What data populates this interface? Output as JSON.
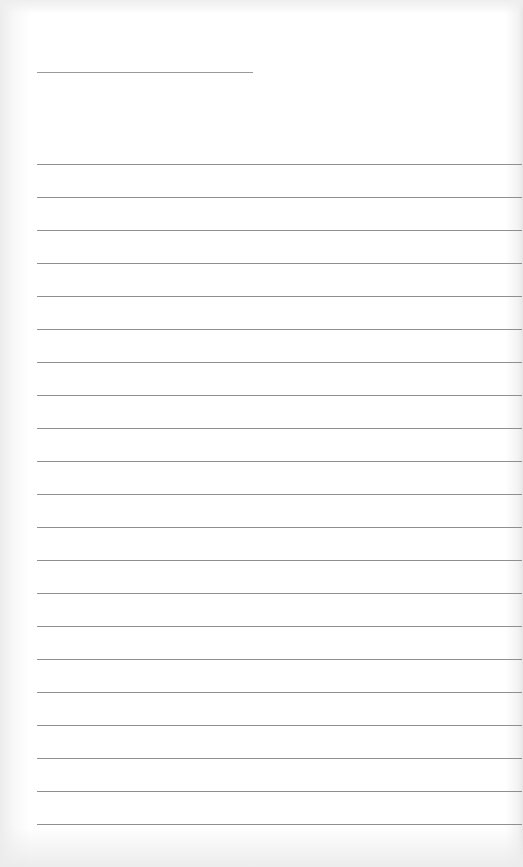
{
  "document": {
    "type": "lined-writing-paper",
    "header": {
      "name_line_text": ""
    },
    "ruled_lines": {
      "count": 21,
      "first_y": 164,
      "spacing_px": 33,
      "left_x": 37,
      "right_x": 522,
      "lines": [
        "",
        "",
        "",
        "",
        "",
        "",
        "",
        "",
        "",
        "",
        "",
        "",
        "",
        "",
        "",
        "",
        "",
        "",
        "",
        "",
        ""
      ]
    },
    "colors": {
      "paper": "#ffffff",
      "rule": "#8f8f8f",
      "edge_shadow": "#e6e6e6"
    }
  }
}
